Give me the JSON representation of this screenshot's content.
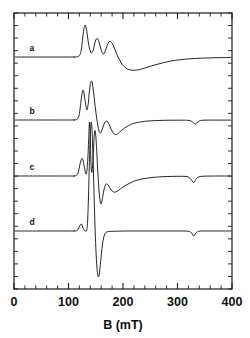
{
  "figure": {
    "background_color": "#ffffff",
    "line_color": "#1a1a1a",
    "plot_box": {
      "left": 14,
      "top": 13,
      "right": 232,
      "bottom": 289
    }
  },
  "chart_data": {
    "type": "line",
    "title": "",
    "subtitle": "",
    "xlabel": "B  (mT)",
    "ylabel": "",
    "xlim": [
      0,
      400
    ],
    "ylim": [
      0,
      1
    ],
    "grid": false,
    "legend_position": "inline-left",
    "xticks": [
      0,
      100,
      200,
      300,
      400
    ],
    "xticklabels": [
      "0",
      "100",
      "200",
      "300",
      "400"
    ],
    "xtick_minor_step": 20,
    "ytick_minor_count": 22,
    "yticklabels": [],
    "annotations": [
      {
        "text": "a",
        "x_mT": 33,
        "baseline": "a"
      },
      {
        "text": "b",
        "x_mT": 33,
        "baseline": "b"
      },
      {
        "text": "c",
        "x_mT": 33,
        "baseline": "c"
      },
      {
        "text": "d",
        "x_mT": 33,
        "baseline": "d"
      }
    ],
    "series": [
      {
        "name": "a",
        "label": "a",
        "baseline_y_px": 57,
        "points_mT_px": [
          [
            0,
            57
          ],
          [
            100,
            57
          ],
          [
            110,
            57
          ],
          [
            115,
            56.8
          ],
          [
            118,
            56.4
          ],
          [
            120,
            55.6
          ],
          [
            122,
            53.5
          ],
          [
            124,
            48
          ],
          [
            126,
            38
          ],
          [
            128,
            30
          ],
          [
            129.5,
            26
          ],
          [
            130.5,
            25
          ],
          [
            132,
            27
          ],
          [
            134,
            33
          ],
          [
            136,
            41
          ],
          [
            138,
            47
          ],
          [
            140,
            51
          ],
          [
            142,
            53
          ],
          [
            144,
            52
          ],
          [
            146,
            49
          ],
          [
            148,
            44
          ],
          [
            150,
            40
          ],
          [
            152,
            38.5
          ],
          [
            154,
            39
          ],
          [
            156,
            42
          ],
          [
            158,
            46
          ],
          [
            160,
            50
          ],
          [
            162,
            53
          ],
          [
            164,
            54
          ],
          [
            166,
            53
          ],
          [
            168,
            50
          ],
          [
            170,
            47
          ],
          [
            172,
            44
          ],
          [
            174,
            42
          ],
          [
            176,
            41.5
          ],
          [
            178,
            42
          ],
          [
            181,
            44
          ],
          [
            184,
            48
          ],
          [
            187,
            52
          ],
          [
            190,
            56
          ],
          [
            194,
            60
          ],
          [
            198,
            64
          ],
          [
            203,
            67
          ],
          [
            208,
            69
          ],
          [
            214,
            70
          ],
          [
            220,
            70.3
          ],
          [
            228,
            69.8
          ],
          [
            236,
            68.7
          ],
          [
            246,
            67
          ],
          [
            258,
            65
          ],
          [
            272,
            63
          ],
          [
            288,
            61
          ],
          [
            304,
            59.8
          ],
          [
            322,
            58.8
          ],
          [
            342,
            58.2
          ],
          [
            364,
            57.8
          ],
          [
            384,
            57.6
          ],
          [
            400,
            57.5
          ]
        ]
      },
      {
        "name": "b",
        "label": "b",
        "baseline_y_px": 120,
        "points_mT_px": [
          [
            0,
            120
          ],
          [
            100,
            120
          ],
          [
            110,
            120
          ],
          [
            114,
            119.6
          ],
          [
            117,
            118.6
          ],
          [
            119,
            116
          ],
          [
            121,
            110
          ],
          [
            123,
            101
          ],
          [
            125,
            93
          ],
          [
            126.5,
            90
          ],
          [
            128,
            92
          ],
          [
            130,
            99
          ],
          [
            132,
            106
          ],
          [
            133.5,
            110
          ],
          [
            135,
            108
          ],
          [
            136.5,
            102
          ],
          [
            138,
            93
          ],
          [
            139.5,
            86
          ],
          [
            141,
            82
          ],
          [
            142.5,
            81
          ],
          [
            144,
            84
          ],
          [
            146,
            92
          ],
          [
            148,
            102
          ],
          [
            150,
            111
          ],
          [
            152,
            119
          ],
          [
            154,
            126
          ],
          [
            156,
            131
          ],
          [
            158,
            133
          ],
          [
            160,
            132
          ],
          [
            162,
            129
          ],
          [
            164,
            126
          ],
          [
            166,
            123
          ],
          [
            168,
            121.5
          ],
          [
            170,
            121
          ],
          [
            172,
            122
          ],
          [
            175,
            125
          ],
          [
            178,
            129
          ],
          [
            181,
            132
          ],
          [
            184,
            134
          ],
          [
            187,
            134.5
          ],
          [
            190,
            134
          ],
          [
            194,
            132
          ],
          [
            198,
            130
          ],
          [
            203,
            128
          ],
          [
            209,
            126
          ],
          [
            216,
            124
          ],
          [
            224,
            122.8
          ],
          [
            234,
            121.8
          ],
          [
            246,
            121
          ],
          [
            260,
            120.6
          ],
          [
            276,
            120.3
          ],
          [
            294,
            120.2
          ],
          [
            310,
            120.2
          ],
          [
            318,
            120.3
          ],
          [
            324,
            120.8
          ],
          [
            328,
            122.2
          ],
          [
            331,
            123.6
          ],
          [
            333,
            123.9
          ],
          [
            335,
            123.2
          ],
          [
            338,
            121.6
          ],
          [
            342,
            120.6
          ],
          [
            348,
            120.2
          ],
          [
            358,
            120.1
          ],
          [
            372,
            120.1
          ],
          [
            388,
            120.1
          ],
          [
            400,
            120.1
          ]
        ]
      },
      {
        "name": "c",
        "label": "c",
        "baseline_y_px": 176,
        "points_mT_px": [
          [
            0,
            176
          ],
          [
            100,
            176
          ],
          [
            110,
            176
          ],
          [
            113,
            175.6
          ],
          [
            116,
            174.6
          ],
          [
            118,
            172
          ],
          [
            120,
            167
          ],
          [
            122,
            162
          ],
          [
            124,
            159
          ],
          [
            125.5,
            158.5
          ],
          [
            127,
            161
          ],
          [
            129,
            167
          ],
          [
            131,
            172
          ],
          [
            132.5,
            174
          ],
          [
            134,
            170
          ],
          [
            135.5,
            158
          ],
          [
            137,
            140
          ],
          [
            138.5,
            122
          ],
          [
            140,
            139
          ],
          [
            141,
            159
          ],
          [
            142,
            170
          ],
          [
            143,
            172
          ],
          [
            144.5,
            164
          ],
          [
            146,
            148
          ],
          [
            147.5,
            133
          ],
          [
            149,
            131
          ],
          [
            150.5,
            139
          ],
          [
            152,
            153
          ],
          [
            153.5,
            169
          ],
          [
            155,
            183
          ],
          [
            156.5,
            194
          ],
          [
            158,
            201
          ],
          [
            159.5,
            204
          ],
          [
            161,
            202
          ],
          [
            163,
            196
          ],
          [
            165,
            190
          ],
          [
            167,
            186
          ],
          [
            169,
            184
          ],
          [
            171,
            184
          ],
          [
            174,
            186
          ],
          [
            177,
            189
          ],
          [
            180,
            191
          ],
          [
            183,
            192
          ],
          [
            186,
            192
          ],
          [
            190,
            191
          ],
          [
            195,
            189
          ],
          [
            200,
            187
          ],
          [
            206,
            185
          ],
          [
            213,
            183
          ],
          [
            221,
            181
          ],
          [
            231,
            179.5
          ],
          [
            243,
            178.2
          ],
          [
            257,
            177.3
          ],
          [
            273,
            176.7
          ],
          [
            291,
            176.4
          ],
          [
            305,
            176.3
          ],
          [
            314,
            176.4
          ],
          [
            320,
            177
          ],
          [
            325,
            179.5
          ],
          [
            328,
            182
          ],
          [
            330,
            182.6
          ],
          [
            332,
            181
          ],
          [
            335,
            178.4
          ],
          [
            339,
            176.9
          ],
          [
            345,
            176.3
          ],
          [
            355,
            176.1
          ],
          [
            370,
            176
          ],
          [
            386,
            176
          ],
          [
            400,
            176
          ]
        ]
      },
      {
        "name": "d",
        "label": "d",
        "baseline_y_px": 231,
        "points_mT_px": [
          [
            0,
            231
          ],
          [
            100,
            231
          ],
          [
            110,
            231
          ],
          [
            114,
            230.8
          ],
          [
            117,
            230
          ],
          [
            119,
            228
          ],
          [
            121,
            225.5
          ],
          [
            123,
            224
          ],
          [
            124.5,
            224.5
          ],
          [
            126,
            227
          ],
          [
            128,
            229.5
          ],
          [
            130,
            230.8
          ],
          [
            132,
            231
          ],
          [
            133.5,
            230
          ],
          [
            135,
            222
          ],
          [
            136.5,
            200
          ],
          [
            138,
            170
          ],
          [
            139.5,
            142
          ],
          [
            141,
            126
          ],
          [
            142,
            122
          ],
          [
            143,
            128
          ],
          [
            144.5,
            148
          ],
          [
            146,
            176
          ],
          [
            147.5,
            206
          ],
          [
            149,
            232
          ],
          [
            150.5,
            252
          ],
          [
            152,
            266
          ],
          [
            153.5,
            274
          ],
          [
            155,
            277
          ],
          [
            156.5,
            274
          ],
          [
            158,
            267
          ],
          [
            160,
            256
          ],
          [
            162,
            246
          ],
          [
            164,
            239
          ],
          [
            166,
            235
          ],
          [
            168,
            233
          ],
          [
            170,
            232
          ],
          [
            173,
            231.6
          ],
          [
            177,
            231.4
          ],
          [
            182,
            231.3
          ],
          [
            188,
            231.2
          ],
          [
            196,
            231.1
          ],
          [
            206,
            231
          ],
          [
            218,
            231
          ],
          [
            232,
            231
          ],
          [
            248,
            231
          ],
          [
            266,
            231
          ],
          [
            284,
            231
          ],
          [
            300,
            231
          ],
          [
            312,
            231
          ],
          [
            319,
            231.2
          ],
          [
            324,
            232
          ],
          [
            328,
            235
          ],
          [
            330,
            236
          ],
          [
            332,
            234.5
          ],
          [
            335,
            232.2
          ],
          [
            339,
            231.3
          ],
          [
            345,
            231
          ],
          [
            356,
            231
          ],
          [
            372,
            231
          ],
          [
            388,
            231
          ],
          [
            400,
            231
          ]
        ]
      }
    ]
  }
}
